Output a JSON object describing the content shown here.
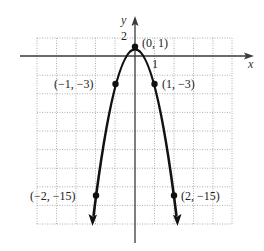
{
  "figure": {
    "x_axis_label": "x",
    "y_axis_label": "y",
    "tick_labels": {
      "x_1": "1",
      "y_2": "2"
    },
    "function": "y = 1 - 4x^2",
    "points": [
      {
        "label": "(0, 1)",
        "x": 0,
        "y": 1
      },
      {
        "label": "(−1, −3)",
        "x": -1,
        "y": -3
      },
      {
        "label": "(1, −3)",
        "x": 1,
        "y": -3
      },
      {
        "label": "(−2, −15)",
        "x": -2,
        "y": -15
      },
      {
        "label": "(2, −15)",
        "x": 2,
        "y": -15
      }
    ],
    "grid": {
      "x_range": [
        -5,
        5
      ],
      "y_range": [
        -18,
        2
      ],
      "x_step": 1,
      "y_step": 2
    },
    "colors": {
      "curve": "#111111",
      "axis": "#3a3a3a",
      "grid": "#9a9a9a"
    }
  }
}
